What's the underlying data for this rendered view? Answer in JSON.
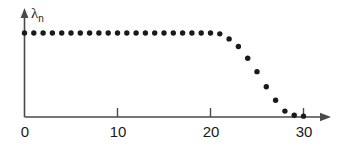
{
  "chart_data": {
    "type": "scatter",
    "title": "",
    "subtitle": "",
    "xlabel": "",
    "ylabel": "lambda_n",
    "ylabel_base": "λ",
    "ylabel_sub": "n",
    "grid": false,
    "legend": "none",
    "xlim": [
      0,
      32
    ],
    "ylim": [
      0,
      1.18
    ],
    "xticks": [
      0,
      10,
      20,
      30
    ],
    "xticklabels": [
      "0",
      "10",
      "20",
      "30"
    ],
    "yticks": [],
    "yticklabels": [],
    "marker": "circle",
    "marker_color": "#1a1a1a",
    "axis_color": "#4a4a4a",
    "background": "#ffffff",
    "x": [
      0,
      1,
      2,
      3,
      4,
      5,
      6,
      7,
      8,
      9,
      10,
      11,
      12,
      13,
      14,
      15,
      16,
      17,
      18,
      19,
      20,
      21,
      22,
      23,
      24,
      25,
      26,
      27,
      28,
      29,
      30
    ],
    "values": [
      1.0,
      1.0,
      1.0,
      1.0,
      1.0,
      1.0,
      1.0,
      1.0,
      1.0,
      1.0,
      1.0,
      1.0,
      1.0,
      1.0,
      1.0,
      1.0,
      1.0,
      1.0,
      1.0,
      1.0,
      1.0,
      0.99,
      0.93,
      0.84,
      0.7,
      0.54,
      0.36,
      0.2,
      0.07,
      0.02,
      0.01
    ],
    "series": [
      {
        "name": "lambda_n",
        "values": [
          1.0,
          1.0,
          1.0,
          1.0,
          1.0,
          1.0,
          1.0,
          1.0,
          1.0,
          1.0,
          1.0,
          1.0,
          1.0,
          1.0,
          1.0,
          1.0,
          1.0,
          1.0,
          1.0,
          1.0,
          1.0,
          0.99,
          0.93,
          0.84,
          0.7,
          0.54,
          0.36,
          0.2,
          0.07,
          0.02,
          0.01
        ]
      }
    ]
  },
  "axes": {
    "x_arrow": "arrow-right",
    "y_arrow": "arrow-up"
  }
}
